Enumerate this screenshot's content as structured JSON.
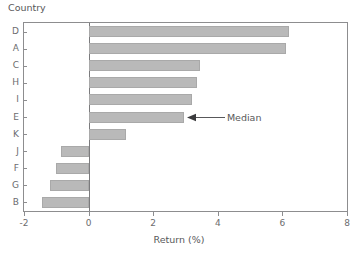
{
  "chart_data": {
    "type": "bar",
    "orientation": "horizontal",
    "title": "",
    "ylabel": "Country",
    "xlabel": "Return (%)",
    "categories": [
      "D",
      "A",
      "C",
      "H",
      "I",
      "E",
      "K",
      "J",
      "F",
      "G",
      "B"
    ],
    "values": [
      6.2,
      6.1,
      3.45,
      3.35,
      3.2,
      2.95,
      1.15,
      -0.85,
      -1.0,
      -1.2,
      -1.45
    ],
    "xlim": [
      -2,
      8
    ],
    "xticks": [
      -2,
      0,
      2,
      4,
      6,
      8
    ],
    "xtick_labels": [
      "-2",
      "0",
      "2",
      "4",
      "6",
      "8"
    ],
    "grid": false,
    "legend": false,
    "bar_color": "#b9b9b9",
    "bar_edge_color": "#a9a9a9",
    "axis_color": "#8d8d8f",
    "zero_line": 0,
    "annotations": [
      {
        "text": "Median",
        "category": "E",
        "value": 2.95,
        "arrow": "left-arrow-icon"
      }
    ]
  },
  "axes": {
    "y_caption": "Country",
    "x_title": "Return (%)"
  }
}
